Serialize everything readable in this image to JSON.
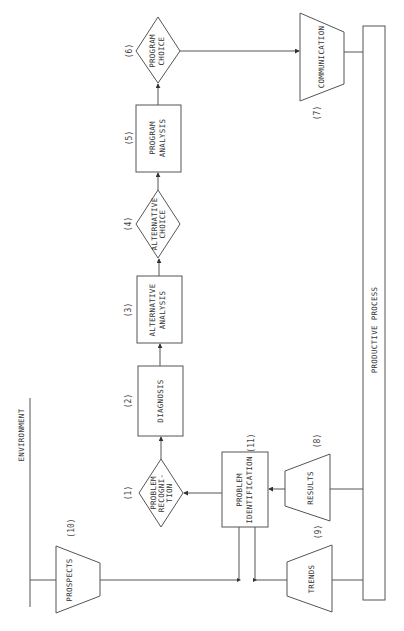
{
  "diagram": {
    "type": "flowchart",
    "orientation": "rotated-90-ccw",
    "environment_label": "ENVIRONMENT",
    "productive_process_label": "PRODUCTIVE PROCESS",
    "nodes": [
      {
        "id": "1",
        "number": "(1)",
        "shape": "diamond",
        "lines": [
          "PROBLEM",
          "RECOGNI-",
          "TION"
        ]
      },
      {
        "id": "2",
        "number": "(2)",
        "shape": "rectangle",
        "lines": [
          "DIAGNOSIS"
        ]
      },
      {
        "id": "3",
        "number": "(3)",
        "shape": "rectangle",
        "lines": [
          "ALTERNATIVE",
          "ANALYSIS"
        ]
      },
      {
        "id": "4",
        "number": "(4)",
        "shape": "diamond",
        "lines": [
          "ALTERNATIVE",
          "CHOICE"
        ]
      },
      {
        "id": "5",
        "number": "(5)",
        "shape": "rectangle",
        "lines": [
          "PROGRAM",
          "ANALYSIS"
        ]
      },
      {
        "id": "6",
        "number": "(6)",
        "shape": "diamond",
        "lines": [
          "PROGRAM",
          "CHOICE"
        ]
      },
      {
        "id": "7",
        "number": "(7)",
        "shape": "trapezoid",
        "lines": [
          "COMMUNICATION"
        ]
      },
      {
        "id": "8",
        "number": "(8)",
        "shape": "trapezoid",
        "lines": [
          "RESULTS"
        ]
      },
      {
        "id": "9",
        "number": "(9)",
        "shape": "trapezoid",
        "lines": [
          "TRENDS"
        ]
      },
      {
        "id": "10",
        "number": "(10)",
        "shape": "trapezoid",
        "lines": [
          "PROSPECTS"
        ]
      },
      {
        "id": "11",
        "number": "(11)",
        "shape": "rectangle",
        "lines": [
          "PROBLEM",
          "IDENTIFICATION"
        ]
      }
    ],
    "edges": [
      {
        "from": "1",
        "to": "2"
      },
      {
        "from": "2",
        "to": "3"
      },
      {
        "from": "3",
        "to": "4"
      },
      {
        "from": "4",
        "to": "5"
      },
      {
        "from": "5",
        "to": "6"
      },
      {
        "from": "6",
        "to": "7"
      },
      {
        "from": "7",
        "to": "productive_process"
      },
      {
        "from": "productive_process",
        "to": "8"
      },
      {
        "from": "productive_process",
        "to": "9"
      },
      {
        "from": "8",
        "to": "11"
      },
      {
        "from": "9",
        "to": "11"
      },
      {
        "from": "10",
        "to": "11"
      },
      {
        "from": "11",
        "to": "1"
      },
      {
        "from": "environment",
        "to": "10"
      }
    ]
  }
}
